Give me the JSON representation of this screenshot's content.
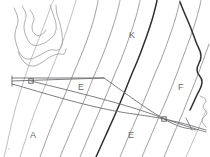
{
  "document": {
    "kind": "scanned-contour-diagram",
    "title": "Contour map fragment with survey overlay",
    "width": 210,
    "height": 157,
    "background_color": "#ffffff"
  },
  "palette": {
    "contour": "#8d8d91",
    "contour_faint": "#a9a9ad",
    "contour_bold": "#2e2e31",
    "overlay": "#6e6e73",
    "label": "#6a6a6f",
    "frame": "#c8c8cc"
  },
  "labels": [
    {
      "id": "label-k",
      "text": "K",
      "x": 129,
      "y": 38,
      "size": 9
    },
    {
      "id": "label-f-right",
      "text": "F",
      "x": 178,
      "y": 90,
      "size": 9
    },
    {
      "id": "label-e-mid",
      "text": "E",
      "x": 78,
      "y": 90,
      "size": 9
    },
    {
      "id": "label-a-left",
      "text": "A",
      "x": 30,
      "y": 138,
      "size": 9
    },
    {
      "id": "label-e-bottom",
      "text": "E",
      "x": 128,
      "y": 138,
      "size": 9
    }
  ],
  "vertices": [
    {
      "id": "vertex-west",
      "x": 31,
      "y": 81,
      "shape": "square"
    },
    {
      "id": "vertex-east",
      "x": 164,
      "y": 119,
      "shape": "square"
    }
  ],
  "overlay_polyline_labels": {
    "top_edge": "horizontal survey baseline",
    "diagonals": "traverse legs"
  },
  "chart_data": {
    "type": "line",
    "xlabel": "",
    "ylabel": "",
    "grid": false,
    "legend": "none",
    "xlim": [
      0,
      210
    ],
    "ylim": [
      0,
      157
    ],
    "note": "Diagonal contour lines trending NE-SW; irregular closed feature at upper left; survey traverse overlay with two marked stations.",
    "series": [
      {
        "name": "contour-1",
        "style": "contour-faint",
        "points": [
          [
            4,
            157
          ],
          [
            8,
            140
          ],
          [
            13,
            118
          ],
          [
            19,
            96
          ],
          [
            26,
            74
          ],
          [
            33,
            54
          ],
          [
            40,
            36
          ],
          [
            46,
            20
          ],
          [
            51,
            6
          ],
          [
            54,
            0
          ]
        ]
      },
      {
        "name": "contour-2",
        "style": "contour-faint",
        "points": [
          [
            20,
            157
          ],
          [
            26,
            138
          ],
          [
            33,
            117
          ],
          [
            41,
            96
          ],
          [
            49,
            76
          ],
          [
            57,
            56
          ],
          [
            64,
            38
          ],
          [
            70,
            20
          ],
          [
            75,
            4
          ],
          [
            76,
            0
          ]
        ]
      },
      {
        "name": "contour-3",
        "style": "contour",
        "points": [
          [
            40,
            157
          ],
          [
            47,
            138
          ],
          [
            55,
            118
          ],
          [
            64,
            97
          ],
          [
            72,
            77
          ],
          [
            80,
            58
          ],
          [
            87,
            40
          ],
          [
            93,
            22
          ],
          [
            97,
            6
          ],
          [
            98,
            0
          ]
        ]
      },
      {
        "name": "contour-4",
        "style": "contour",
        "points": [
          [
            60,
            157
          ],
          [
            68,
            138
          ],
          [
            77,
            117
          ],
          [
            86,
            96
          ],
          [
            94,
            76
          ],
          [
            102,
            57
          ],
          [
            109,
            38
          ],
          [
            115,
            20
          ],
          [
            119,
            5
          ],
          [
            120,
            0
          ]
        ]
      },
      {
        "name": "contour-5",
        "style": "contour",
        "points": [
          [
            80,
            157
          ],
          [
            88,
            138
          ],
          [
            97,
            117
          ],
          [
            106,
            96
          ],
          [
            114,
            76
          ],
          [
            122,
            57
          ],
          [
            129,
            38
          ],
          [
            135,
            20
          ],
          [
            139,
            5
          ],
          [
            140,
            0
          ]
        ]
      },
      {
        "name": "contour-6-bold",
        "style": "contour-bold",
        "points": [
          [
            96,
            157
          ],
          [
            105,
            137
          ],
          [
            114,
            117
          ],
          [
            123,
            96
          ],
          [
            131,
            76
          ],
          [
            139,
            57
          ],
          [
            146,
            38
          ],
          [
            152,
            20
          ],
          [
            156,
            5
          ],
          [
            157,
            0
          ]
        ]
      },
      {
        "name": "contour-7",
        "style": "contour",
        "points": [
          [
            120,
            157
          ],
          [
            128,
            138
          ],
          [
            137,
            117
          ],
          [
            146,
            96
          ],
          [
            154,
            76
          ],
          [
            162,
            57
          ],
          [
            169,
            38
          ],
          [
            175,
            20
          ],
          [
            179,
            5
          ],
          [
            180,
            0
          ]
        ]
      },
      {
        "name": "contour-8",
        "style": "contour",
        "points": [
          [
            142,
            157
          ],
          [
            150,
            138
          ],
          [
            159,
            117
          ],
          [
            168,
            96
          ],
          [
            176,
            76
          ],
          [
            183,
            57
          ],
          [
            190,
            38
          ],
          [
            196,
            20
          ],
          [
            200,
            5
          ],
          [
            201,
            0
          ]
        ]
      },
      {
        "name": "contour-9",
        "style": "contour",
        "points": [
          [
            164,
            157
          ],
          [
            172,
            138
          ],
          [
            181,
            117
          ],
          [
            189,
            97
          ],
          [
            197,
            77
          ],
          [
            204,
            58
          ],
          [
            209,
            44
          ]
        ]
      },
      {
        "name": "contour-10-bold",
        "style": "contour-bold",
        "points": [
          [
            190,
            110
          ],
          [
            196,
            97
          ],
          [
            202,
            82
          ],
          [
            197,
            70
          ],
          [
            201,
            56
          ],
          [
            196,
            42
          ],
          [
            190,
            26
          ],
          [
            184,
            12
          ],
          [
            180,
            2
          ]
        ]
      },
      {
        "name": "contour-11",
        "style": "contour-faint",
        "points": [
          [
            186,
            157
          ],
          [
            193,
            141
          ],
          [
            200,
            125
          ],
          [
            206,
            110
          ]
        ]
      },
      {
        "name": "feature-outline-upper",
        "style": "feature-outline",
        "points": [
          [
            14,
            8
          ],
          [
            18,
            20
          ],
          [
            15,
            34
          ],
          [
            17,
            46
          ],
          [
            22,
            56
          ],
          [
            30,
            59
          ],
          [
            40,
            55
          ],
          [
            50,
            50
          ],
          [
            58,
            50
          ],
          [
            62,
            45
          ],
          [
            62,
            34
          ],
          [
            60,
            24
          ],
          [
            57,
            14
          ],
          [
            56,
            5
          ]
        ]
      },
      {
        "name": "feature-outline-inner",
        "style": "feature-outline",
        "points": [
          [
            22,
            6
          ],
          [
            26,
            15
          ],
          [
            24,
            27
          ],
          [
            27,
            38
          ],
          [
            33,
            45
          ],
          [
            42,
            44
          ],
          [
            50,
            39
          ],
          [
            55,
            33
          ],
          [
            56,
            24
          ],
          [
            53,
            14
          ],
          [
            50,
            5
          ]
        ]
      },
      {
        "name": "feature-outline-tail",
        "style": "feature-outline",
        "points": [
          [
            18,
            52
          ],
          [
            24,
            62
          ],
          [
            32,
            66
          ],
          [
            41,
            63
          ],
          [
            50,
            57
          ],
          [
            58,
            54
          ],
          [
            64,
            54
          ],
          [
            66,
            49
          ]
        ]
      },
      {
        "name": "feature-outline-hook",
        "style": "feature-outline",
        "points": [
          [
            30,
            10
          ],
          [
            34,
            18
          ],
          [
            32,
            27
          ],
          [
            35,
            34
          ],
          [
            41,
            35
          ],
          [
            46,
            30
          ]
        ]
      },
      {
        "name": "right-edge-squiggle",
        "style": "feature-outline",
        "points": [
          [
            200,
            96
          ],
          [
            206,
            100
          ],
          [
            203,
            107
          ],
          [
            207,
            113
          ],
          [
            202,
            120
          ],
          [
            206,
            127
          ]
        ]
      },
      {
        "name": "overlay-baseline",
        "style": "overlay-line",
        "points": [
          [
            12,
            78
          ],
          [
            104,
            78
          ]
        ]
      },
      {
        "name": "overlay-leg-upper",
        "style": "overlay-line",
        "points": [
          [
            12,
            81
          ],
          [
            104,
            78
          ]
        ]
      },
      {
        "name": "overlay-leg-long",
        "style": "overlay-line",
        "points": [
          [
            12,
            84
          ],
          [
            96,
            107
          ],
          [
            164,
            119
          ],
          [
            206,
            130
          ]
        ]
      },
      {
        "name": "overlay-leg-diagonal",
        "style": "overlay-line",
        "points": [
          [
            104,
            78
          ],
          [
            164,
            119
          ],
          [
            196,
            130
          ]
        ]
      },
      {
        "name": "overlay-leg-return",
        "style": "overlay-line",
        "points": [
          [
            31,
            81
          ],
          [
            120,
            104
          ],
          [
            180,
            124
          ],
          [
            206,
            132
          ]
        ]
      },
      {
        "name": "overlay-tick-left",
        "style": "overlay-line",
        "points": [
          [
            12,
            76
          ],
          [
            12,
            86
          ]
        ]
      },
      {
        "name": "overlay-tick-right",
        "style": "overlay-line",
        "points": [
          [
            186,
            118
          ],
          [
            192,
            130
          ]
        ]
      }
    ]
  }
}
